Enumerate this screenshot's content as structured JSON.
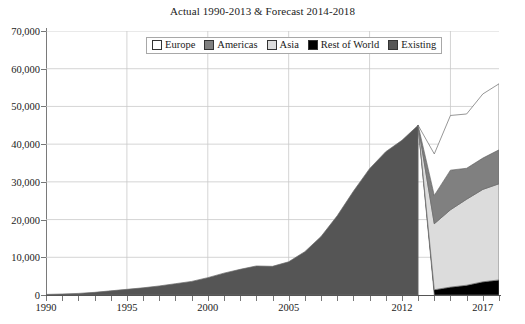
{
  "chart_data": {
    "type": "area",
    "title": "Actual 1990-2013 & Forecast 2014-2018",
    "xlabel": "",
    "ylabel": "",
    "xlim": [
      1990,
      2018
    ],
    "ylim": [
      0,
      70000
    ],
    "grid": true,
    "legend_position": "top-center",
    "ytick_labels": [
      "0",
      "10,000",
      "20,000",
      "30,000",
      "40,000",
      "50,000",
      "60,000",
      "70,000"
    ],
    "ytick_values": [
      0,
      10000,
      20000,
      30000,
      40000,
      50000,
      60000,
      70000
    ],
    "xtick_values": [
      1990,
      1991,
      1992,
      1993,
      1994,
      1995,
      1996,
      1997,
      1998,
      1999,
      2000,
      2001,
      2002,
      2003,
      2004,
      2005,
      2006,
      2007,
      2008,
      2009,
      2010,
      2011,
      2012,
      2013,
      2014,
      2015,
      2016,
      2017,
      2018
    ],
    "xtick_labels_shown": [
      {
        "value": 1990,
        "label": "1990"
      },
      {
        "value": 1995,
        "label": "1995"
      },
      {
        "value": 2000,
        "label": "2000"
      },
      {
        "value": 2005,
        "label": "2005"
      },
      {
        "value": 2012,
        "label": "2012"
      },
      {
        "value": 2017,
        "label": "2017"
      }
    ],
    "x": [
      1990,
      1991,
      1992,
      1993,
      1994,
      1995,
      1996,
      1997,
      1998,
      1999,
      2000,
      2001,
      2002,
      2003,
      2004,
      2005,
      2006,
      2007,
      2008,
      2009,
      2010,
      2011,
      2012,
      2013,
      2014,
      2015,
      2016,
      2017,
      2018
    ],
    "series": [
      {
        "name": "Existing",
        "color": "#555555",
        "stack_order": 0,
        "values": [
          150,
          260,
          420,
          700,
          1100,
          1500,
          1900,
          2400,
          3000,
          3600,
          4600,
          5800,
          6800,
          7700,
          7600,
          8800,
          11500,
          15500,
          21000,
          27500,
          33500,
          38000,
          41000,
          45000,
          0,
          0,
          0,
          0,
          0
        ]
      },
      {
        "name": "Rest of World",
        "color": "#000000",
        "stack_order": 1,
        "values": [
          0,
          0,
          0,
          0,
          0,
          0,
          0,
          0,
          0,
          0,
          0,
          0,
          0,
          0,
          0,
          0,
          0,
          0,
          0,
          0,
          0,
          0,
          0,
          0,
          1400,
          2100,
          2600,
          3500,
          4000
        ]
      },
      {
        "name": "Asia",
        "color": "#dcdcdc",
        "stack_order": 2,
        "values": [
          0,
          0,
          0,
          0,
          0,
          0,
          0,
          0,
          0,
          0,
          0,
          0,
          0,
          0,
          0,
          0,
          0,
          0,
          0,
          0,
          0,
          0,
          0,
          0,
          17500,
          20500,
          22800,
          24500,
          25500
        ]
      },
      {
        "name": "Americas",
        "color": "#808080",
        "stack_order": 3,
        "values": [
          0,
          0,
          0,
          0,
          0,
          0,
          0,
          0,
          0,
          0,
          0,
          0,
          0,
          0,
          0,
          0,
          0,
          0,
          0,
          0,
          0,
          0,
          0,
          0,
          7500,
          10500,
          8200,
          8300,
          9000
        ]
      },
      {
        "name": "Europe",
        "color": "#ffffff",
        "stack_order": 4,
        "values": [
          0,
          0,
          0,
          0,
          0,
          0,
          0,
          0,
          0,
          0,
          0,
          0,
          0,
          0,
          0,
          0,
          0,
          0,
          0,
          0,
          0,
          0,
          0,
          0,
          11000,
          14500,
          14400,
          17000,
          17500
        ]
      }
    ],
    "stacked_totals_forecast": [
      {
        "year": 2014,
        "total": 37400
      },
      {
        "year": 2015,
        "total": 47600
      },
      {
        "year": 2016,
        "total": 48000
      },
      {
        "year": 2017,
        "total": 53300
      },
      {
        "year": 2018,
        "total": 56000
      }
    ]
  },
  "legend": {
    "items": [
      {
        "label": "Europe",
        "color": "#ffffff"
      },
      {
        "label": "Americas",
        "color": "#808080"
      },
      {
        "label": "Asia",
        "color": "#dcdcdc"
      },
      {
        "label": "Rest of World",
        "color": "#000000"
      },
      {
        "label": "Existing",
        "color": "#555555"
      }
    ]
  }
}
